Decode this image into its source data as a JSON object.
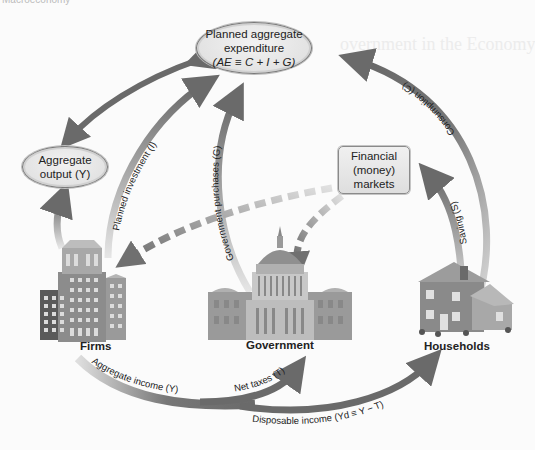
{
  "header_fragment": "Macroeconomy",
  "nodes": {
    "planned_ae": {
      "line1": "Planned aggregate",
      "line2": "expenditure",
      "line3": "(AE ≡ C + I + G)"
    },
    "aggregate_output": {
      "line1": "Aggregate",
      "line2": "output (Y)"
    },
    "financial_markets": {
      "line1": "Financial",
      "line2": "(money)",
      "line3": "markets"
    }
  },
  "entities": {
    "firms": "Firms",
    "government": "Government",
    "households": "Households"
  },
  "flows": {
    "consumption": "Consumption (C)",
    "saving": "Saving (S)",
    "planned_investment": "Planned investment (I)",
    "government_purchases": "Government purchases (G)",
    "aggregate_income": "Aggregate income (Y)",
    "net_taxes": "Net taxes (T)",
    "disposable_income": "Disposable income (Yd ≡ Y − T)"
  },
  "colors": {
    "arrow_dark": "#6e6e6e",
    "arrow_light": "#c9c9c9",
    "dashed": "#7a7a7a",
    "background": "#fbfbfb"
  }
}
